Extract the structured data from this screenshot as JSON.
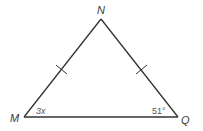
{
  "diagram": {
    "type": "isosceles-triangle",
    "vertices": [
      {
        "name": "N",
        "label": "N",
        "x": 101,
        "y": 19
      },
      {
        "name": "M",
        "label": "M",
        "x": 24,
        "y": 117
      },
      {
        "name": "Q",
        "label": "Q",
        "x": 178,
        "y": 117
      }
    ],
    "angles": {
      "M": "3x",
      "Q": "51°"
    },
    "congruent_sides": [
      "MN",
      "NQ"
    ],
    "line_color": "#333333"
  }
}
